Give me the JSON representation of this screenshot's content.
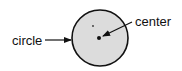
{
  "diagram": {
    "labels": {
      "circle": "circle",
      "center": "center"
    },
    "colors": {
      "circle_fill": "#dcdcdc",
      "stroke": "#111111"
    }
  }
}
